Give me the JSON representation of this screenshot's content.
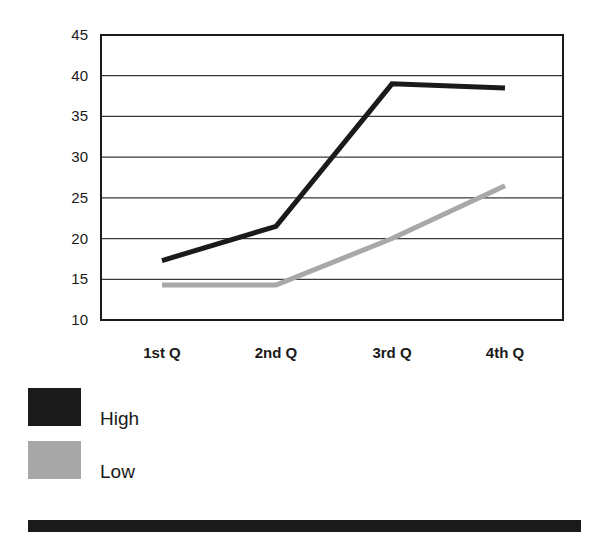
{
  "chart_data": {
    "type": "line",
    "title": "",
    "xlabel": "",
    "ylabel": "",
    "categories": [
      "1st Q",
      "2nd Q",
      "3rd Q",
      "4th Q"
    ],
    "series": [
      {
        "name": "High",
        "color": "#1a1a1a",
        "values": [
          17.3,
          21.5,
          39.0,
          38.5
        ]
      },
      {
        "name": "Low",
        "color": "#a8a8a8",
        "values": [
          14.3,
          14.3,
          20.0,
          26.5
        ]
      }
    ],
    "ylim": [
      10,
      45
    ],
    "yticks": [
      10,
      15,
      20,
      25,
      30,
      35,
      40,
      45
    ],
    "grid": {
      "horizontal": true,
      "vertical": false
    },
    "legend_position": "bottom-left"
  },
  "legend": {
    "items": [
      {
        "label": "High",
        "color": "#1a1a1a"
      },
      {
        "label": "Low",
        "color": "#a8a8a8"
      }
    ]
  }
}
